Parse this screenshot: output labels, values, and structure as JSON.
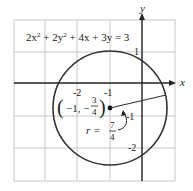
{
  "figure": {
    "equation": {
      "lhs_parts": [
        "2x",
        "2",
        " + 2y",
        "2",
        " + 4x + 3y = 3"
      ],
      "full": "2x² + 2y² + 4x + 3y = 3"
    },
    "axes": {
      "x_label": "x",
      "y_label": "y",
      "x_ticks": [
        "-2",
        "-1"
      ],
      "y_ticks": [
        "1",
        "-1",
        "-2"
      ]
    },
    "center_label": {
      "open": "(",
      "x": "−1,",
      "minus": "−",
      "num": "3",
      "den": "4",
      "close": ")"
    },
    "radius_label": {
      "prefix": "r =",
      "num": "7",
      "den": "4"
    },
    "colors": {
      "grid": "#c8c8c8",
      "axis": "#222222",
      "circle": "#333333"
    }
  }
}
